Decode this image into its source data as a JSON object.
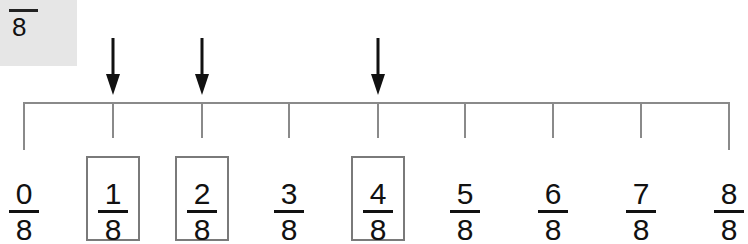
{
  "answer_box": {
    "numerator": "",
    "denominator": "8"
  },
  "number_line": {
    "ticks": [
      {
        "num": "0",
        "den": "8",
        "x": 24,
        "boxed": false,
        "arrow": false,
        "end": true
      },
      {
        "num": "1",
        "den": "8",
        "x": 113,
        "boxed": true,
        "arrow": true,
        "end": false
      },
      {
        "num": "2",
        "den": "8",
        "x": 202,
        "boxed": true,
        "arrow": true,
        "end": false
      },
      {
        "num": "3",
        "den": "8",
        "x": 289,
        "boxed": false,
        "arrow": false,
        "end": false
      },
      {
        "num": "4",
        "den": "8",
        "x": 378,
        "boxed": true,
        "arrow": true,
        "end": false
      },
      {
        "num": "5",
        "den": "8",
        "x": 465,
        "boxed": false,
        "arrow": false,
        "end": false
      },
      {
        "num": "6",
        "den": "8",
        "x": 553,
        "boxed": false,
        "arrow": false,
        "end": false
      },
      {
        "num": "7",
        "den": "8",
        "x": 641,
        "boxed": false,
        "arrow": false,
        "end": false
      },
      {
        "num": "8",
        "den": "8",
        "x": 729,
        "boxed": false,
        "arrow": false,
        "end": true
      }
    ]
  },
  "colors": {
    "line": "#8a8a8a",
    "box_border": "#7a7a7a",
    "answer_bg": "#e6e6e6",
    "text": "#111111"
  }
}
